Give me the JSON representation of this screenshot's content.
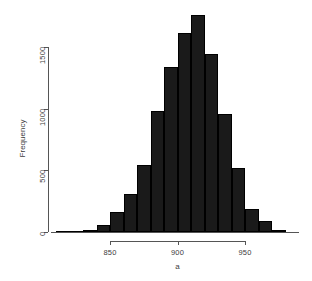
{
  "chart_data": {
    "type": "bar",
    "subtype": "histogram",
    "title": "",
    "xlabel": "a",
    "ylabel": "Frequency",
    "xlim": [
      806,
      990
    ],
    "ylim": [
      0,
      1800
    ],
    "grid": false,
    "legend": "none",
    "bar_color": "#1a1a1a",
    "bin_width": 10,
    "x_ticks": [
      850,
      900,
      950
    ],
    "x_tick_labels": [
      "850",
      "900",
      "950"
    ],
    "y_ticks": [
      0,
      500,
      1000,
      1500
    ],
    "y_tick_labels": [
      "0",
      "500",
      "1000",
      "1500"
    ],
    "bin_starts": [
      810,
      820,
      830,
      840,
      850,
      860,
      870,
      880,
      890,
      900,
      910,
      920,
      930,
      940,
      950,
      960,
      970
    ],
    "bin_ends": [
      820,
      830,
      840,
      850,
      860,
      870,
      880,
      890,
      900,
      910,
      920,
      930,
      940,
      950,
      960,
      970,
      980
    ],
    "categories": [
      "810-820",
      "820-830",
      "830-840",
      "840-850",
      "850-860",
      "860-870",
      "870-880",
      "880-890",
      "890-900",
      "900-910",
      "910-920",
      "920-930",
      "930-940",
      "940-950",
      "950-960",
      "960-970",
      "970-980"
    ],
    "values": [
      5,
      10,
      20,
      55,
      160,
      310,
      540,
      980,
      1340,
      1610,
      1760,
      1440,
      960,
      515,
      190,
      90,
      15
    ]
  },
  "axes": {
    "x_title": "a",
    "y_title": "Frequency"
  }
}
